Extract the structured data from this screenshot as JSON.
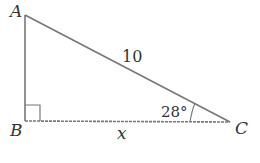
{
  "diagram": {
    "type": "right-triangle",
    "vertices": {
      "A": "A",
      "B": "B",
      "C": "C"
    },
    "hypotenuse_label": "10",
    "base_label": "x",
    "angle_label": "28°",
    "right_angle_at": "B",
    "line_color": "#777777"
  }
}
